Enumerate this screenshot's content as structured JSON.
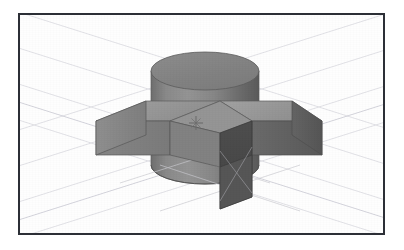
{
  "app": {
    "title": "3D Modeling Viewport",
    "type": "cad-viewport"
  },
  "viewport": {
    "name": "perspective-viewport",
    "background_color": "#fefefe",
    "border_color": "#2c2f36",
    "border_width_px": 2,
    "bounds": {
      "x": 18,
      "y": 13,
      "width": 367,
      "height": 222
    }
  },
  "grid": {
    "visible": true,
    "color": "#dcdce2",
    "accent_color": "#cfcfd8",
    "line_width": 0.8,
    "description": "faint perspective ground grid"
  },
  "cursor": {
    "name": "crosshair-marker",
    "x": 196,
    "y": 123,
    "color": "#6b6b6b",
    "size": 16
  },
  "model": {
    "name": "cylinder-with-slot-block",
    "parts": [
      {
        "id": "cylinder",
        "kind": "cylinder",
        "center_x": 202,
        "top_y": 66,
        "rx": 54,
        "ry": 19,
        "height": 120,
        "top_face_color": "#848484",
        "side_light_color": "#8e8e8e",
        "side_dark_color": "#5e5e5e"
      },
      {
        "id": "block",
        "kind": "box",
        "top_face_color": "#9a9a9a",
        "front_face_color": "#7d7d7d",
        "side_face_color": "#6e6e6e",
        "slot_face_color": "#4a4a4a",
        "slot_floor_color": "#565656"
      }
    ],
    "edge_color": "#4c4c4c",
    "highlight_color": "#e8e8ee"
  },
  "colors": {
    "page_background": "#ffffff",
    "frame_stroke": "#2c2f36",
    "mid_gray": "#808080",
    "dark_gray": "#4a4a4a",
    "light_gray": "#a0a0a0"
  }
}
